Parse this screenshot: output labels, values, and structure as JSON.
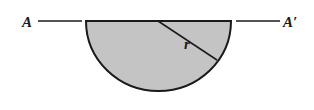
{
  "diagram": {
    "left_label": "A",
    "right_label": "A′",
    "radius_label": "r",
    "shape": "semicircle",
    "fill_color": "#c4c4c4",
    "stroke_color": "#1a1a1a"
  }
}
